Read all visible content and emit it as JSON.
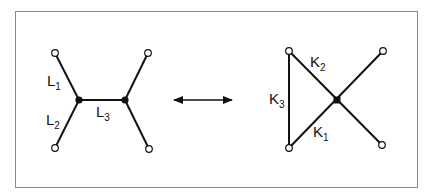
{
  "diagram": {
    "type": "graph-equivalence",
    "left_graph": {
      "nodes": [
        {
          "id": "a",
          "kind": "open",
          "x": 55,
          "y": 53
        },
        {
          "id": "b",
          "kind": "open",
          "x": 55,
          "y": 148
        },
        {
          "id": "c",
          "kind": "filled",
          "x": 79,
          "y": 100
        },
        {
          "id": "d",
          "kind": "filled",
          "x": 125,
          "y": 100
        },
        {
          "id": "e",
          "kind": "open",
          "x": 148,
          "y": 53
        },
        {
          "id": "f",
          "kind": "open",
          "x": 149,
          "y": 149
        }
      ],
      "edges": [
        {
          "from": "a",
          "to": "c",
          "label": "L",
          "sub": "1"
        },
        {
          "from": "b",
          "to": "c",
          "label": "L",
          "sub": "2"
        },
        {
          "from": "c",
          "to": "d",
          "label": "L",
          "sub": "3"
        },
        {
          "from": "d",
          "to": "e"
        },
        {
          "from": "d",
          "to": "f"
        }
      ]
    },
    "arrow": {
      "type": "double-headed",
      "x1": 173,
      "x2": 232,
      "y": 100
    },
    "right_graph": {
      "nodes": [
        {
          "id": "p",
          "kind": "open",
          "x": 289,
          "y": 51
        },
        {
          "id": "q",
          "kind": "open",
          "x": 289,
          "y": 148
        },
        {
          "id": "r",
          "kind": "filled",
          "x": 337,
          "y": 100
        },
        {
          "id": "s",
          "kind": "open",
          "x": 383,
          "y": 51
        },
        {
          "id": "t",
          "kind": "open",
          "x": 382,
          "y": 145
        }
      ],
      "edges": [
        {
          "from": "p",
          "to": "q",
          "label": "K",
          "sub": "3"
        },
        {
          "from": "p",
          "to": "t",
          "label": "K",
          "sub": "2"
        },
        {
          "from": "q",
          "to": "s",
          "label": "K",
          "sub": "1"
        }
      ]
    },
    "labels": {
      "L1": {
        "main": "L",
        "sub": "1"
      },
      "L2": {
        "main": "L",
        "sub": "2"
      },
      "L3": {
        "main": "L",
        "sub": "3"
      },
      "K1": {
        "main": "K",
        "sub": "1"
      },
      "K2": {
        "main": "K",
        "sub": "2"
      },
      "K3": {
        "main": "K",
        "sub": "3"
      }
    },
    "colors": {
      "line": "#111111",
      "frame": "#8a8a8a",
      "background": "#ffffff"
    }
  }
}
